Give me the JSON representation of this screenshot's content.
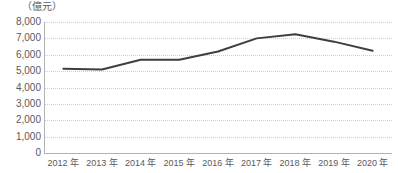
{
  "chart_data": {
    "type": "line",
    "title": "",
    "subtitle": "",
    "unit_label": "（億元）",
    "xlabel": "",
    "ylabel": "",
    "categories": [
      "2012 年",
      "2013 年",
      "2014 年",
      "2015 年",
      "2016 年",
      "2017 年",
      "2018 年",
      "2019 年",
      "2020 年"
    ],
    "series": [
      {
        "name": "",
        "values": [
          5150,
          5100,
          5700,
          5700,
          6200,
          7000,
          7250,
          6800,
          6250
        ]
      }
    ],
    "ylim": [
      0,
      8000
    ],
    "ytick_values": [
      8000,
      7000,
      6000,
      5000,
      4000,
      3000,
      2000,
      1000,
      0
    ],
    "ytick_labels": [
      "8,000",
      "7,000",
      "6,000",
      "5,000",
      "4,000",
      "3,000",
      "2,000",
      "1,000",
      "0"
    ],
    "grid": true,
    "grid_axis": "y",
    "legend": false,
    "legend_position": "none",
    "markers": false,
    "colors": {
      "line": "#3f3f3f",
      "grid": "#cfcfcf",
      "axis": "#b4b4b4",
      "text": "#5a5a5a",
      "background": "#ffffff"
    },
    "line_width": 2
  }
}
